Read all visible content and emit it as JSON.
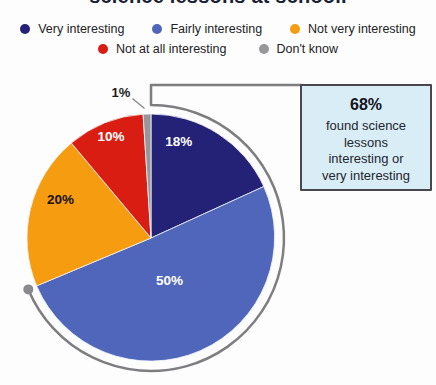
{
  "title": "science lessons at school.",
  "legend": {
    "items": [
      {
        "label": "Very interesting",
        "color": "#232276"
      },
      {
        "label": "Fairly interesting",
        "color": "#4f66bb"
      },
      {
        "label": "Not very interesting",
        "color": "#f69c10"
      },
      {
        "label": "Not at all interesting",
        "color": "#d91d12"
      },
      {
        "label": "Don't know",
        "color": "#97979a"
      }
    ]
  },
  "chart_data": {
    "type": "pie",
    "title": "science lessons at school.",
    "categories": [
      "Very interesting",
      "Fairly interesting",
      "Not very interesting",
      "Not at all interesting",
      "Don't know"
    ],
    "values": [
      18,
      50,
      20,
      10,
      1
    ],
    "unit": "%",
    "slice_labels": [
      "18%",
      "50%",
      "20%",
      "10%",
      "1%"
    ],
    "colors": [
      "#232276",
      "#4f66bb",
      "#f69c10",
      "#d91d12",
      "#97979a"
    ],
    "slice_label_colors": [
      "#ffffff",
      "#ffffff",
      "#16130e",
      "#ffffff",
      "#1c1c1c"
    ],
    "start_angle_deg": 0,
    "direction": "clockwise",
    "legend_position": "top",
    "highlight_arc": {
      "covers_categories": [
        "Very interesting",
        "Fairly interesting"
      ],
      "covers_total_label": "68%",
      "color": "#7e7e81"
    }
  },
  "callout": {
    "headline": "68%",
    "lines": [
      "found science",
      "lessons",
      "interesting or",
      "very interesting"
    ],
    "bg": "#d8edf6",
    "border": "#48484c"
  }
}
